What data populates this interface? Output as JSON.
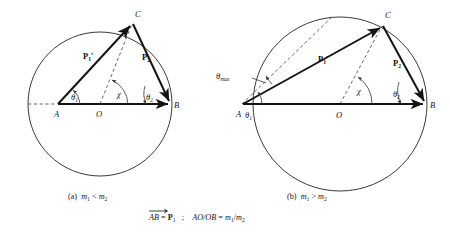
{
  "figure": {
    "type": "vector-diagram",
    "panels": [
      {
        "id": "a",
        "caption_prefix": "(a)",
        "caption_relation": "m₁ < m₂",
        "caption_m1": "m",
        "caption_m1_sub": "1",
        "caption_op": "<",
        "caption_m2": "m",
        "caption_m2_sub": "2",
        "points": [
          {
            "name": "A",
            "label": "A",
            "x": 58,
            "y": 104,
            "inside_circle": true
          },
          {
            "name": "O",
            "label": "O",
            "x": 100,
            "y": 104,
            "is_center": true
          },
          {
            "name": "B",
            "label": "B",
            "x": 172,
            "y": 104,
            "on_circle": true
          },
          {
            "name": "C",
            "label": "C",
            "x": 133,
            "y": 23,
            "on_circle": true
          }
        ],
        "circle": {
          "cx": 100,
          "cy": 104,
          "r": 72
        },
        "vectors": [
          {
            "name": "p1-prime",
            "label": "P",
            "sub": "1",
            "prime": "′",
            "from": "A",
            "to": "C",
            "label_x": 85,
            "label_y": 57
          },
          {
            "name": "p2",
            "label": "P",
            "sub": "2",
            "prime": "",
            "from": "C",
            "to": "B",
            "label_x": 147,
            "label_y": 58
          },
          {
            "name": "p1-axis",
            "label": "",
            "sub": "",
            "prime": "",
            "from": "A",
            "to": "B",
            "label_x": 0,
            "label_y": 0
          }
        ],
        "angles": [
          {
            "name": "theta1",
            "symbol": "θ",
            "sub": "1",
            "at": "A",
            "label_x": 73,
            "label_y": 99
          },
          {
            "name": "chi",
            "symbol": "χ",
            "sub": "",
            "label_x": 119,
            "label_y": 96
          },
          {
            "name": "theta2",
            "symbol": "θ",
            "sub": "2",
            "at": "B",
            "label_x": 149,
            "label_y": 99
          }
        ],
        "dashed_lines": [
          {
            "name": "left-axis-extension",
            "from_x": 28,
            "from_y": 104,
            "to_x": 58,
            "to_y": 104
          },
          {
            "name": "radius-OC",
            "from_x": 100,
            "from_y": 104,
            "to_x": 133,
            "to_y": 23
          }
        ]
      },
      {
        "id": "b",
        "caption_prefix": "(b)",
        "caption_relation": "m₁ > m₂",
        "caption_m1": "m",
        "caption_m1_sub": "1",
        "caption_op": ">",
        "caption_m2": "m",
        "caption_m2_sub": "2",
        "points": [
          {
            "name": "A",
            "label": "A",
            "x": 242,
            "y": 104,
            "inside_circle": false
          },
          {
            "name": "O",
            "label": "O",
            "x": 340,
            "y": 104,
            "is_center": true
          },
          {
            "name": "B",
            "label": "B",
            "x": 427,
            "y": 104,
            "on_circle": true
          },
          {
            "name": "C",
            "label": "C",
            "x": 383,
            "y": 25,
            "on_circle": true
          }
        ],
        "circle": {
          "cx": 340,
          "cy": 104,
          "r": 87
        },
        "vectors": [
          {
            "name": "p1-prime",
            "label": "P",
            "sub": "1",
            "prime": "′",
            "from": "A",
            "to": "C",
            "label_x": 321,
            "label_y": 60
          },
          {
            "name": "p2",
            "label": "P",
            "sub": "2",
            "prime": "",
            "from": "C",
            "to": "B",
            "label_x": 398,
            "label_y": 64
          },
          {
            "name": "p1-axis",
            "label": "",
            "sub": "",
            "prime": "",
            "from": "A",
            "to": "B",
            "label_x": 0,
            "label_y": 0
          }
        ],
        "angles": [
          {
            "name": "theta-max",
            "symbol": "θ",
            "sub": "max",
            "label_x": 220,
            "label_y": 76
          },
          {
            "name": "theta1",
            "symbol": "θ",
            "sub": "1",
            "at": "A",
            "label_x": 247,
            "label_y": 116
          },
          {
            "name": "chi",
            "symbol": "χ",
            "sub": "",
            "label_x": 360,
            "label_y": 93
          },
          {
            "name": "theta2",
            "symbol": "θ",
            "sub": "2",
            "at": "B",
            "label_x": 397,
            "label_y": 96
          }
        ],
        "dashed_lines": [
          {
            "name": "tangent-line",
            "from_x": 242,
            "from_y": 104,
            "to_x": 330,
            "to_y": 18
          },
          {
            "name": "radius-OC",
            "from_x": 340,
            "from_y": 104,
            "to_x": 383,
            "to_y": 25
          }
        ]
      }
    ],
    "formula": {
      "vector_ab": "AB",
      "vector_arrow": "→",
      "equals": "=",
      "p1_label": "P",
      "p1_sub": "1",
      "separator": ";",
      "ratio_left": "AO/OB",
      "ratio_equals": "=",
      "ratio_right_num": "m",
      "ratio_right_num_sub": "1",
      "ratio_slash": "/",
      "ratio_right_den": "m",
      "ratio_right_den_sub": "2"
    },
    "colors": {
      "ink": "#161616",
      "vector": "#141414",
      "circle": "#3a3a3a",
      "dashed": "#4a4a4a",
      "background": "#ffffff"
    }
  }
}
